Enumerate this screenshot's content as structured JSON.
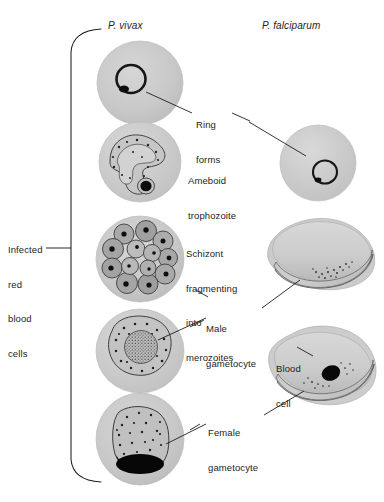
{
  "figure": {
    "background_color": "#ffffff",
    "ink_color": "#1d1d1d",
    "cell_fill": "#c9c9c9",
    "parasite_fill": "#a8a8a8",
    "nucleus_color": "#111111"
  },
  "columns": [
    {
      "id": "vivax",
      "label": "P. vivax",
      "x": 108,
      "y": 20
    },
    {
      "id": "falciparum",
      "label": "P. falciparum",
      "x": 262,
      "y": 20
    }
  ],
  "bracket_label": {
    "name": "infected-red-blood-cells",
    "lines": [
      "Infected",
      "red",
      "blood",
      "cells"
    ],
    "x": 8,
    "y": 221
  },
  "annotations": [
    {
      "id": "ring-forms",
      "lines": [
        "Ring",
        "forms"
      ],
      "x": 196,
      "y": 96,
      "leaders": [
        "from vivax ring cell",
        "to falciparum ring cell"
      ]
    },
    {
      "id": "ameboid-trophozoite",
      "lines": [
        "Ameboid",
        "trophozoite"
      ],
      "x": 188,
      "y": 152,
      "leaders": []
    },
    {
      "id": "schizont-fragmenting",
      "lines": [
        "Schizont",
        "fragmenting",
        "into",
        "merozoites"
      ],
      "x": 186,
      "y": 225,
      "leaders": []
    },
    {
      "id": "male-gametocyte",
      "lines": [
        "Male",
        "gametocyte"
      ],
      "x": 206,
      "y": 300,
      "leaders": [
        "to vivax male gametocyte",
        "to falciparum male gametocyte"
      ]
    },
    {
      "id": "blood-cell",
      "lines": [
        "Blood",
        "cell"
      ],
      "x": 276,
      "y": 340,
      "leaders": [
        "to falciparum blood cell envelope"
      ]
    },
    {
      "id": "female-gametocyte",
      "lines": [
        "Female",
        "gametocyte"
      ],
      "x": 208,
      "y": 404,
      "leaders": [
        "to vivax female gametocyte",
        "to falciparum female gametocyte"
      ]
    }
  ],
  "cells": [
    {
      "id": "vivax-ring-form",
      "column": "vivax",
      "stage": "ring form",
      "cx": 140,
      "cy": 83,
      "rx": 43,
      "ry": 42
    },
    {
      "id": "vivax-ameboid-trophozoite",
      "column": "vivax",
      "stage": "ameboid trophozoite",
      "cx": 140,
      "cy": 162,
      "rx": 41,
      "ry": 40
    },
    {
      "id": "vivax-schizont",
      "column": "vivax",
      "stage": "schizont",
      "cx": 140,
      "cy": 259,
      "rx": 44,
      "ry": 43
    },
    {
      "id": "vivax-male-gametocyte",
      "column": "vivax",
      "stage": "male gametocyte",
      "cx": 140,
      "cy": 351,
      "rx": 44,
      "ry": 42
    },
    {
      "id": "vivax-female-gametocyte",
      "column": "vivax",
      "stage": "female gametocyte",
      "cx": 140,
      "cy": 439,
      "rx": 44,
      "ry": 46
    },
    {
      "id": "falciparum-ring-form",
      "column": "falciparum",
      "stage": "ring form",
      "cx": 318,
      "cy": 163,
      "rx": 38,
      "ry": 38
    },
    {
      "id": "falciparum-male-gametocyte",
      "column": "falciparum",
      "stage": "male gametocyte (crescent)",
      "cx": 320,
      "cy": 258,
      "rx": 55,
      "ry": 36
    },
    {
      "id": "falciparum-female-gametocyte",
      "column": "falciparum",
      "stage": "female gametocyte (crescent)",
      "cx": 322,
      "cy": 367,
      "rx": 55,
      "ry": 42
    }
  ]
}
